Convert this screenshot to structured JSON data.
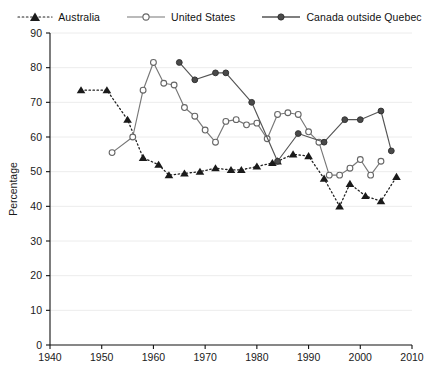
{
  "chart_data": {
    "type": "line",
    "title": "",
    "xlabel": "",
    "ylabel": "Percentage",
    "xlim": [
      1940,
      2010
    ],
    "ylim": [
      0,
      90
    ],
    "xticks": [
      1940,
      1950,
      1960,
      1970,
      1980,
      1990,
      2000,
      2010
    ],
    "yticks": [
      0,
      10,
      20,
      30,
      40,
      50,
      60,
      70,
      80,
      90
    ],
    "grid": "horizontal",
    "legend_position": "top-center",
    "series": [
      {
        "name": "Australia",
        "color": "#222222",
        "line_style": "dotted",
        "marker": "filled-triangle",
        "x": [
          1946,
          1951,
          1955,
          1958,
          1961,
          1963,
          1966,
          1969,
          1972,
          1975,
          1977,
          1980,
          1983,
          1984,
          1987,
          1990,
          1993,
          1996,
          1998,
          2001,
          2004,
          2007
        ],
        "y": [
          73.5,
          73.5,
          65.0,
          54.0,
          52.0,
          49.0,
          49.5,
          50.0,
          51.0,
          50.5,
          50.5,
          51.5,
          52.5,
          53.0,
          55.0,
          54.5,
          48.0,
          40.0,
          46.5,
          43.0,
          41.5,
          48.5
        ]
      },
      {
        "name": "United States",
        "color": "#777777",
        "line_style": "solid",
        "marker": "open-circle",
        "x": [
          1952,
          1956,
          1958,
          1960,
          1962,
          1964,
          1966,
          1968,
          1970,
          1972,
          1974,
          1976,
          1978,
          1980,
          1982,
          1984,
          1986,
          1988,
          1990,
          1992,
          1994,
          1996,
          1998,
          2000,
          2002,
          2004
        ],
        "y": [
          55.5,
          60.0,
          73.5,
          81.5,
          75.5,
          75.0,
          68.5,
          66.0,
          62.0,
          58.5,
          64.5,
          65.0,
          63.5,
          64.0,
          59.5,
          66.5,
          67.0,
          66.5,
          61.5,
          58.5,
          49.0,
          49.0,
          51.0,
          53.5,
          49.0,
          53.0
        ]
      },
      {
        "name": "Canada outside Quebec",
        "color": "#555555",
        "line_style": "solid",
        "marker": "filled-circle",
        "x": [
          1965,
          1968,
          1972,
          1974,
          1979,
          1984,
          1988,
          1993,
          1997,
          2000,
          2004,
          2006
        ],
        "y": [
          81.5,
          76.5,
          78.5,
          78.5,
          70.0,
          53.0,
          61.0,
          58.5,
          65.0,
          65.0,
          67.5,
          56.0
        ]
      }
    ]
  },
  "legend": {
    "items": [
      {
        "label": "Australia"
      },
      {
        "label": "United States"
      },
      {
        "label": "Canada outside Quebec"
      }
    ]
  },
  "axis": {
    "y_title": "Percentage",
    "y_labels": [
      "90",
      "80",
      "70",
      "60",
      "50",
      "40",
      "30",
      "20",
      "10",
      "0"
    ],
    "x_labels": [
      "1940",
      "1950",
      "1960",
      "1970",
      "1980",
      "1990",
      "2000",
      "2010"
    ]
  }
}
